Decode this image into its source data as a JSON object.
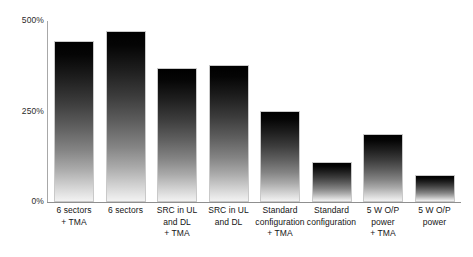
{
  "chart_data": {
    "type": "bar",
    "title": "",
    "xlabel": "",
    "ylabel": "",
    "grid": false,
    "legend": false,
    "ylim": [
      0,
      500
    ],
    "yticks": [
      "0%",
      "250%",
      "500%"
    ],
    "ytick_values": [
      0,
      250,
      500
    ],
    "categories": [
      "6 sectors\n+ TMA",
      "6 sectors",
      "SRC in UL\nand DL\n+ TMA",
      "SRC in UL\nand DL",
      "Standard\nconfiguration\n+ TMA",
      "Standard\nconfiguration",
      "5 W O/P\npower\n+ TMA",
      "5 W O/P\npower"
    ],
    "values": [
      444,
      472,
      369,
      378,
      250,
      111,
      189,
      75
    ],
    "value_unit": "%",
    "bar_gradient_top": "#000000",
    "bar_gradient_bottom": "#f2f2f2",
    "bar_border_color": "#c9c9c9",
    "axis_color": "#8f8f8f",
    "background_color": "#ffffff"
  }
}
